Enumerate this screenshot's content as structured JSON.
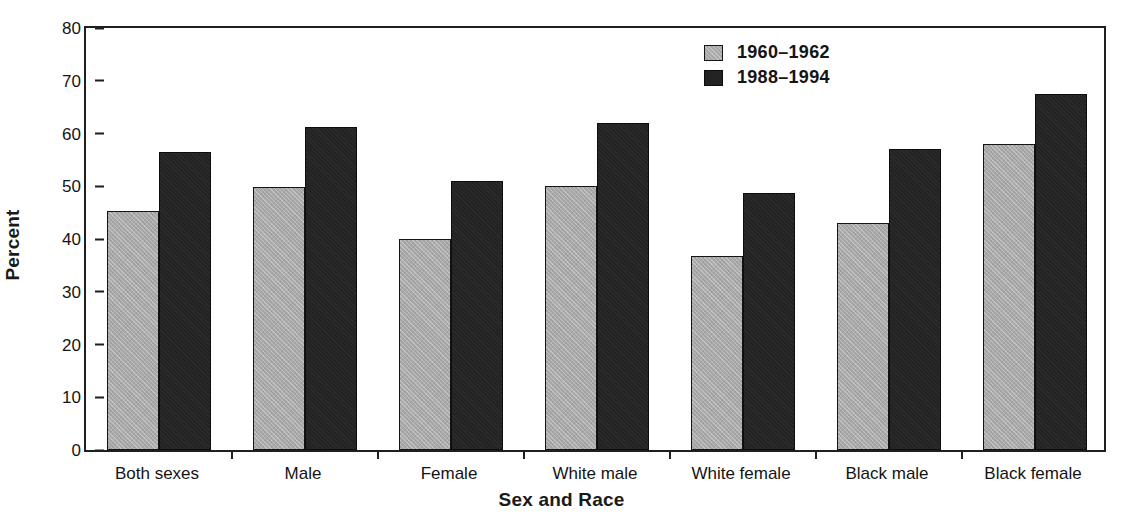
{
  "chart_data": {
    "type": "bar",
    "title": "",
    "xlabel": "Sex and Race",
    "ylabel": "Percent",
    "ylim": [
      0,
      80
    ],
    "yticks": [
      0,
      10,
      20,
      30,
      40,
      50,
      60,
      70,
      80
    ],
    "grid": false,
    "legend_position": "top-right",
    "categories": [
      "Both sexes",
      "Male",
      "Female",
      "White male",
      "White female",
      "Black male",
      "Black female"
    ],
    "series": [
      {
        "name": "1960–1962",
        "color": "#a8a8a8",
        "values": [
          44.8,
          49.3,
          39.7,
          49.5,
          36.4,
          42.6,
          57.5
        ]
      },
      {
        "name": "1988–1994",
        "color": "#232323",
        "values": [
          55.9,
          60.7,
          50.6,
          61.4,
          48.2,
          56.5,
          66.8
        ]
      }
    ]
  },
  "legend": {
    "items": [
      {
        "label": "1960–1962",
        "swatch": "gray-swatch-icon"
      },
      {
        "label": "1988–1994",
        "swatch": "dark-swatch-icon"
      }
    ]
  },
  "axes": {
    "y_title": "Percent",
    "x_title": "Sex and Race",
    "y_tick_labels": [
      "80",
      "70",
      "60",
      "50",
      "40",
      "30",
      "20",
      "10",
      "0"
    ],
    "x_tick_labels": [
      "Both sexes",
      "Male",
      "Female",
      "White male",
      "White female",
      "Black male",
      "Black female"
    ]
  }
}
